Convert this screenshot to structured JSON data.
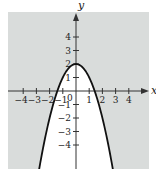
{
  "chart_data": {
    "type": "line",
    "title": "",
    "xlabel": "x",
    "ylabel": "y",
    "equation": "y = 2 - x^2",
    "shading": "region outside the parabola (y > 2 - x^2) shaded gray; inside unshaded",
    "xlim": [
      -5.1,
      5.5
    ],
    "ylim": [
      -5.8,
      5.8
    ],
    "grid": false,
    "x_ticks": [
      -4,
      -3,
      -2,
      -1,
      1,
      2,
      3,
      4
    ],
    "y_ticks": [
      -4,
      -3,
      -2,
      -1,
      1,
      2,
      3,
      4
    ],
    "x_tick_labels": [
      "−4",
      "−3",
      "−2",
      "−1",
      "1",
      "2",
      "3",
      "4"
    ],
    "y_tick_labels": [
      "−4",
      "−3",
      "−2",
      "−1",
      "1",
      "2",
      "3",
      "4"
    ],
    "origin_label": "0",
    "series": [
      {
        "name": "parabola",
        "x": [
          -2.8,
          -2.5,
          -2,
          -1.5,
          -1.41,
          -1,
          -0.5,
          0,
          0.5,
          1,
          1.41,
          1.5,
          2,
          2.5,
          2.8
        ],
        "y": [
          -5.84,
          -4.25,
          -2,
          -0.25,
          0,
          1,
          1.75,
          2,
          1.75,
          1,
          0,
          -0.25,
          -2,
          -4.25,
          -5.84
        ]
      }
    ],
    "key_points": {
      "vertex": [
        0,
        2
      ],
      "x_intercepts": [
        -1.41,
        1.41
      ]
    },
    "colors": {
      "shaded_region": "#d9dcdb",
      "unshaded_region": "#ffffff",
      "curve": "#111111",
      "axes": "#333333"
    }
  }
}
